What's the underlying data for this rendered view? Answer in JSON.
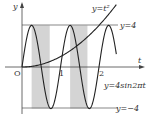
{
  "chart_data": {
    "type": "line",
    "title": "",
    "xlabel": "t",
    "ylabel": "y",
    "origin_label": "O",
    "x_ticks": [
      "1",
      "2"
    ],
    "series": [
      {
        "name": "y=t²",
        "label": "y=t²",
        "formula": "t^2"
      },
      {
        "name": "y=4sin2πt",
        "label": "y=4sin2πt",
        "formula": "4*sin(2*pi*t)"
      },
      {
        "name": "y=4",
        "label": "y=4",
        "formula": "4"
      },
      {
        "name": "y=-4",
        "label": "y=−4",
        "formula": "-4"
      }
    ],
    "shaded_intervals": [
      [
        0.25,
        0.72
      ],
      [
        1.25,
        1.7
      ]
    ],
    "xlim": [
      0,
      2.45
    ],
    "ylim": [
      -4,
      4
    ],
    "colors": {
      "curve": "#222222",
      "shade": "#d4d4d4",
      "axis": "#444444"
    }
  },
  "labels": {
    "y_axis": "y",
    "t_axis": "t",
    "origin": "O",
    "tick1": "1",
    "tick2": "2",
    "parabola": "y=t²",
    "line_top": "y=4",
    "line_bottom": "y=−4",
    "sine": "y=4sin2πt"
  }
}
